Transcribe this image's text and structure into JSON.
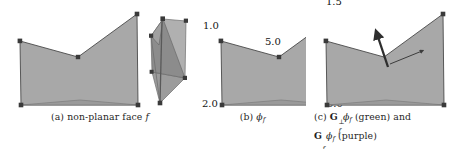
{
  "figure": {
    "type": "academic-figure",
    "background_color": "#ffffff",
    "ink_color": "#1f1f1f",
    "face_fill_color": "#a9a9a9",
    "face_fill_color_dark": "#8f8f8f",
    "face_edge_color": "#4d4d4d",
    "vertex_color": "#3d3d3d"
  },
  "panels": [
    {
      "id": "a",
      "caption_prefix": "(a)",
      "caption_text": "non-planar face",
      "caption_symbol": "f",
      "has_inset_3d": true,
      "polygon_vertices": [
        {
          "x": 20,
          "y": 41
        },
        {
          "x": 78,
          "y": 57
        },
        {
          "x": 137,
          "y": 14
        },
        {
          "x": 138,
          "y": 105
        },
        {
          "x": 21,
          "y": 105
        }
      ],
      "fold_vertices": [
        {
          "x": 21,
          "y": 105
        },
        {
          "x": 80,
          "y": 101
        },
        {
          "x": 138,
          "y": 105
        }
      ],
      "inset_vertices": [
        {
          "x": 163,
          "y": 18
        },
        {
          "x": 151,
          "y": 35
        },
        {
          "x": 186,
          "y": 20
        },
        {
          "x": 185,
          "y": 77
        },
        {
          "x": 160,
          "y": 103
        },
        {
          "x": 150,
          "y": 72
        }
      ]
    },
    {
      "id": "b",
      "caption_prefix": "(b)",
      "caption_symbol": "phi_f",
      "has_inset_3d": false,
      "polygon_vertices": [
        {
          "x": 27,
          "y": 41
        },
        {
          "x": 85,
          "y": 57
        },
        {
          "x": 144,
          "y": 14
        },
        {
          "x": 145,
          "y": 105
        },
        {
          "x": 28,
          "y": 105
        }
      ],
      "value_labels": [
        {
          "text": "1.0",
          "x": 12,
          "y": 26,
          "anchor": "vertex-top-left"
        },
        {
          "text": "5.0",
          "x": 74,
          "y": 42,
          "anchor": "vertex-notch"
        },
        {
          "text": "1.5",
          "x": 133,
          "y": 1,
          "anchor": "vertex-top-right"
        },
        {
          "text": "2.0",
          "x": 12,
          "y": 100,
          "anchor": "vertex-bottom-left"
        },
        {
          "text": "0.0",
          "x": 133,
          "y": 100,
          "anchor": "vertex-bottom-right"
        }
      ]
    },
    {
      "id": "c",
      "caption_prefix": "(c)",
      "caption_line1_a": "G",
      "caption_line1_sup": "⊥",
      "caption_line1_sub": "f",
      "caption_line1_b": "ϕ",
      "caption_line1_bsub": "f",
      "caption_line1_paren": "(green)",
      "caption_line1_and": "and",
      "caption_line2_a": "G",
      "caption_line2_sub": "f",
      "caption_line2_b": "ϕ",
      "caption_line2_bsub": "f",
      "caption_line2_paren": "(purple)",
      "has_inset_3d": false,
      "polygon_vertices": [
        {
          "x": 26,
          "y": 41
        },
        {
          "x": 84,
          "y": 57
        },
        {
          "x": 143,
          "y": 14
        },
        {
          "x": 144,
          "y": 105
        },
        {
          "x": 27,
          "y": 105
        }
      ],
      "arrows": [
        {
          "name": "gradient-perp-arrow",
          "legend": "green",
          "from": {
            "x": 90,
            "y": 64
          },
          "to": {
            "x": 126,
            "y": 50
          },
          "thickness": 1.1
        },
        {
          "name": "gradient-arrow",
          "legend": "purple",
          "from": {
            "x": 88,
            "y": 67
          },
          "to": {
            "x": 77,
            "y": 32
          },
          "thickness": 2.4
        }
      ]
    }
  ]
}
